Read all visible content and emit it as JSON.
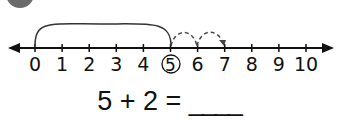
{
  "number_line": {
    "min": 0,
    "max": 10,
    "labels": [
      "0",
      "1",
      "2",
      "3",
      "4",
      "5",
      "6",
      "7",
      "8",
      "9",
      "10"
    ],
    "circled_label": "5",
    "start": 5,
    "jumps": [
      {
        "from": 5,
        "to": 6
      },
      {
        "from": 6,
        "to": 7
      }
    ],
    "big_arc": {
      "from": 0,
      "to": 5
    }
  },
  "equation": {
    "text": "5 + 2 = ",
    "blank": "____"
  },
  "badge": {
    "color": "#6b6b6b"
  }
}
